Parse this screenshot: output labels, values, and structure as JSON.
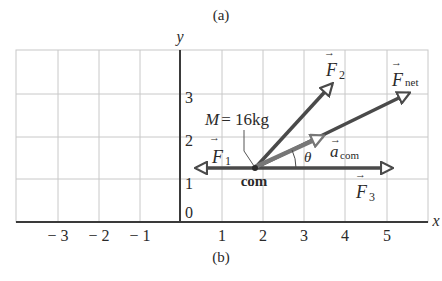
{
  "captions": {
    "top": "(a)",
    "bottom": "(b)"
  },
  "axes": {
    "x_label": "x",
    "y_label": "y",
    "x_ticks": [
      "− 3",
      "− 2",
      "− 1",
      "1",
      "2",
      "3",
      "4",
      "5"
    ],
    "y_ticks": [
      "0",
      "1",
      "2",
      "3"
    ]
  },
  "body": {
    "mass_label": "M = 16kg",
    "com_label": "com",
    "angle_label": "θ"
  },
  "vectors": {
    "F1": {
      "main": "F",
      "sub": "1"
    },
    "F2": {
      "main": "F",
      "sub": "2"
    },
    "F3": {
      "main": "F",
      "sub": "3"
    },
    "Fnet": {
      "main": "F",
      "sub": "net"
    },
    "acom": {
      "main": "a",
      "sub": "com"
    }
  },
  "colors": {
    "grid": "#c8c8c8",
    "axis": "#3a3a3a",
    "vector": "#4a4a4a",
    "acom": "#777777"
  }
}
